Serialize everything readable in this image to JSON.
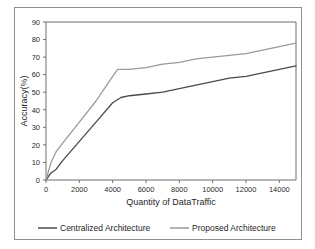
{
  "chart_data": {
    "type": "line",
    "title": "",
    "xlabel": "Quantity of DataTraffic",
    "ylabel": "Accuracy(%)",
    "xlim": [
      0,
      15000
    ],
    "ylim": [
      0,
      90
    ],
    "xticks": [
      0,
      2000,
      4000,
      6000,
      8000,
      10000,
      12000,
      14000
    ],
    "xtick_labels": [
      "0",
      "2000",
      "4000",
      "6000",
      "8000",
      "10000",
      "12000",
      "14000"
    ],
    "yticks": [
      0,
      10,
      20,
      30,
      40,
      50,
      60,
      70,
      80,
      90
    ],
    "ytick_labels": [
      "0",
      "10",
      "20",
      "30",
      "40",
      "50",
      "60",
      "70",
      "80",
      "90"
    ],
    "grid": false,
    "legend_position": "below",
    "series": [
      {
        "name": "Centralized Architecture",
        "color": "#4a4a4a",
        "x": [
          0,
          300,
          600,
          1000,
          2000,
          3000,
          4000,
          4500,
          5000,
          6000,
          7000,
          8000,
          9000,
          10000,
          11000,
          12000,
          13000,
          14000,
          15000
        ],
        "values": [
          0,
          4,
          6,
          11,
          22,
          33,
          44,
          47,
          48,
          49,
          50,
          52,
          54,
          56,
          58,
          59,
          61,
          63,
          65
        ]
      },
      {
        "name": "Proposed Architecture",
        "color": "#9a9a9a",
        "x": [
          0,
          300,
          600,
          1000,
          2000,
          3000,
          4000,
          4300,
          5000,
          6000,
          7000,
          8000,
          9000,
          10000,
          11000,
          12000,
          13000,
          14000,
          15000
        ],
        "values": [
          0,
          10,
          16,
          21,
          33,
          45,
          59,
          63,
          63,
          64,
          66,
          67,
          69,
          70,
          71,
          72,
          74,
          76,
          78
        ]
      }
    ]
  },
  "legend": {
    "entries": [
      {
        "label": "Centralized Architecture",
        "color": "#4a4a4a"
      },
      {
        "label": "Proposed Architecture",
        "color": "#9a9a9a"
      }
    ]
  },
  "axes": {
    "x_title": "Quantity of DataTraffic",
    "y_title": "Accuracy(%)"
  }
}
